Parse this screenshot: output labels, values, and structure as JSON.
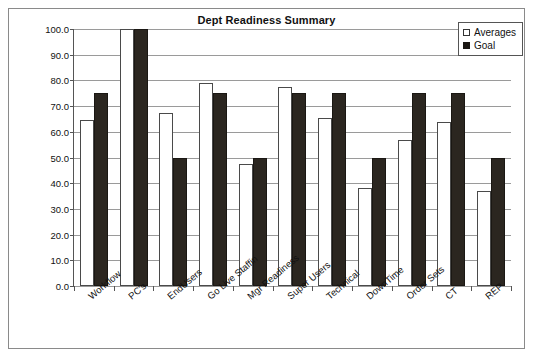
{
  "chart_data": {
    "type": "bar",
    "title": "Dept Readiness Summary",
    "xlabel": "",
    "ylabel": "",
    "ylim": [
      0.0,
      100.0
    ],
    "ytick_step": 10.0,
    "ytick_labels": [
      "100.0",
      "90.0",
      "80.0",
      "70.0",
      "60.0",
      "50.0",
      "40.0",
      "30.0",
      "20.0",
      "10.0",
      "0.0"
    ],
    "grid": true,
    "legend_position": "top-right",
    "categories": [
      "Workflow",
      "PC's",
      "EndUsers",
      "Go Live Staffin",
      "Mgr Readiness",
      "Super Users",
      "Technical",
      "DownTime",
      "Order Sets",
      "CT",
      "REP"
    ],
    "series": [
      {
        "name": "Averages",
        "color": "#ffffff",
        "values": [
          64.5,
          100.0,
          67.5,
          79.0,
          47.5,
          77.5,
          65.5,
          38.0,
          57.0,
          64.0,
          37.0
        ]
      },
      {
        "name": "Goal",
        "color": "#1a1713",
        "values": [
          75.0,
          100.0,
          50.0,
          75.0,
          50.0,
          75.0,
          75.0,
          50.0,
          75.0,
          75.0,
          50.0
        ]
      }
    ]
  },
  "legend": {
    "items": [
      {
        "label": "Averages",
        "swatch": "hollow-square-icon"
      },
      {
        "label": "Goal",
        "swatch": "filled-square-icon"
      }
    ]
  }
}
